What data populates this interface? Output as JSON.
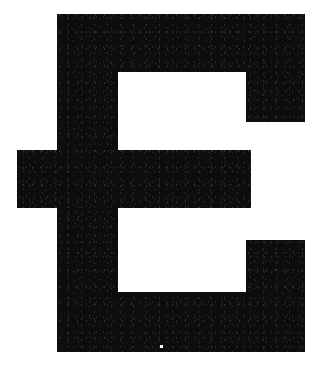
{
  "image": {
    "kind": "glyph-bitmap",
    "width": 323,
    "height": 368,
    "background_color": "#ffffff",
    "ink_color": "#0d0d0d",
    "alt_text": "Bold sans-serif capital letter E",
    "character": "E",
    "description": "Scanned high-contrast bitmap of a heavy slab-like capital letter E with a protruding lower-left arm"
  },
  "glyph": {
    "label": "E",
    "weight": "black",
    "style": "sans-serif",
    "outline_points": "57,14 305,14 305,122 246,122 246,72 118,72 118,150 251,150 251,208 118,208 118,292 246,292 246,240 305,240 305,352 57,352 57,208 17,208 17,150 57,150",
    "parts": [
      {
        "name": "upper-terminal-bar",
        "x": 57,
        "y": 14,
        "width": 248,
        "height": 108
      },
      {
        "name": "vertical-stem",
        "x": 57,
        "y": 14,
        "width": 61,
        "height": 338
      },
      {
        "name": "middle-arm",
        "x": 17,
        "y": 150,
        "width": 234,
        "height": 58
      },
      {
        "name": "left-spur",
        "x": 17,
        "y": 150,
        "width": 40,
        "height": 58
      },
      {
        "name": "lower-terminal-bar",
        "x": 57,
        "y": 240,
        "width": 248,
        "height": 112
      },
      {
        "name": "upper-counter",
        "x": 118,
        "y": 72,
        "width": 128,
        "height": 78
      },
      {
        "name": "lower-counter",
        "x": 118,
        "y": 208,
        "width": 128,
        "height": 84
      }
    ],
    "speck": {
      "name": "scan-speck",
      "x": 160,
      "y": 345,
      "width": 3,
      "height": 3
    }
  }
}
